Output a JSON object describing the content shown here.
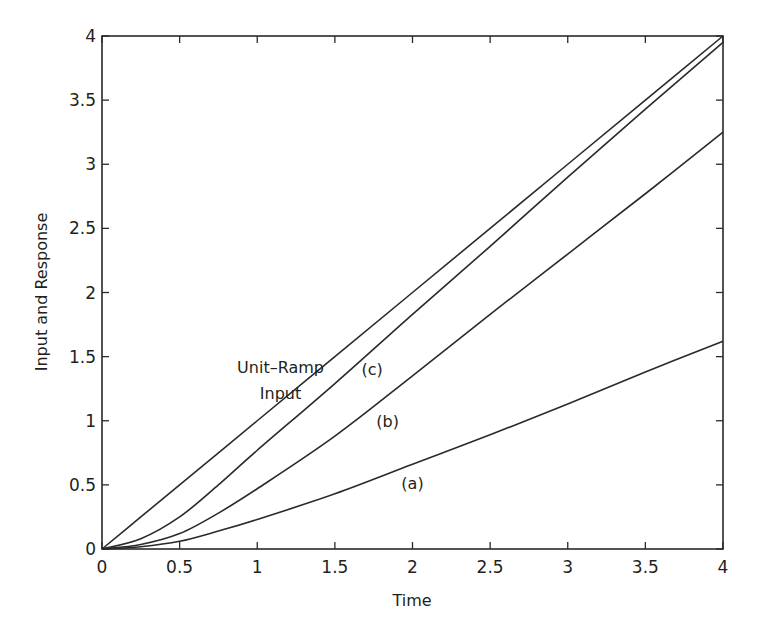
{
  "chart_data": {
    "type": "line",
    "title": "",
    "xlabel": "Time",
    "ylabel": "Input and Response",
    "xlim": [
      0,
      4
    ],
    "ylim": [
      0,
      4
    ],
    "grid": false,
    "legend": "none",
    "x_ticks": [
      "0",
      "0.5",
      "1",
      "1.5",
      "2",
      "2.5",
      "3",
      "3.5",
      "4"
    ],
    "y_ticks": [
      "0",
      "0.5",
      "1",
      "1.5",
      "2",
      "2.5",
      "3",
      "3.5",
      "4"
    ],
    "x": [
      0,
      0.25,
      0.5,
      0.75,
      1,
      1.5,
      2,
      2.5,
      3,
      3.5,
      4
    ],
    "series": [
      {
        "name": "Unit-Ramp Input",
        "values": [
          0,
          0.25,
          0.5,
          0.75,
          1,
          1.5,
          2,
          2.5,
          3,
          3.5,
          4
        ]
      },
      {
        "name": "(c)",
        "values": [
          0,
          0.08,
          0.25,
          0.5,
          0.77,
          1.29,
          1.83,
          2.36,
          2.9,
          3.43,
          3.95
        ]
      },
      {
        "name": "(b)",
        "values": [
          0,
          0.035,
          0.12,
          0.28,
          0.47,
          0.88,
          1.35,
          1.83,
          2.3,
          2.77,
          3.25
        ]
      },
      {
        "name": "(a)",
        "values": [
          0,
          0.018,
          0.06,
          0.14,
          0.23,
          0.43,
          0.66,
          0.89,
          1.13,
          1.38,
          1.62
        ]
      }
    ],
    "annotations": [
      {
        "text": "Unit–Ramp",
        "x": 1.15,
        "y": 1.37
      },
      {
        "text": "Input",
        "x": 1.15,
        "y": 1.17
      },
      {
        "text": "(c)",
        "x": 1.74,
        "y": 1.36
      },
      {
        "text": "(b)",
        "x": 1.84,
        "y": 0.95
      },
      {
        "text": "(a)",
        "x": 2.0,
        "y": 0.47
      }
    ]
  }
}
